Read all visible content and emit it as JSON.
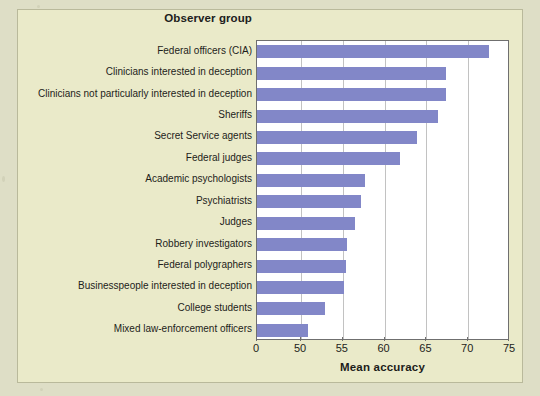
{
  "chart_data": {
    "type": "bar",
    "orientation": "horizontal",
    "title": "Observer group",
    "xlabel": "Mean accuracy",
    "ylabel": "",
    "grid": true,
    "legend": null,
    "xlim": [
      50,
      75
    ],
    "axis_break": true,
    "xticks": [
      0,
      50,
      55,
      60,
      65,
      70,
      75
    ],
    "xticklabels": [
      "0",
      "50",
      "55",
      "60",
      "65",
      "70",
      "75"
    ],
    "bar_color": "#8287c8",
    "plot_background": "#ffffff",
    "figure_background": "#eaeac9",
    "categories": [
      "Federal officers (CIA)",
      "Clinicians interested in deception",
      "Clinicians not particularly interested in deception",
      "Sheriffs",
      "Secret Service agents",
      "Federal judges",
      "Academic psychologists",
      "Psychiatrists",
      "Judges",
      "Robbery investigators",
      "Federal polygraphers",
      "Businesspeople interested in deception",
      "College students",
      "Mixed law-enforcement officers"
    ],
    "values": [
      72.5,
      67.3,
      67.3,
      66.4,
      63.9,
      61.8,
      57.6,
      57.2,
      56.4,
      55.5,
      55.4,
      55.2,
      52.9,
      50.8
    ]
  }
}
